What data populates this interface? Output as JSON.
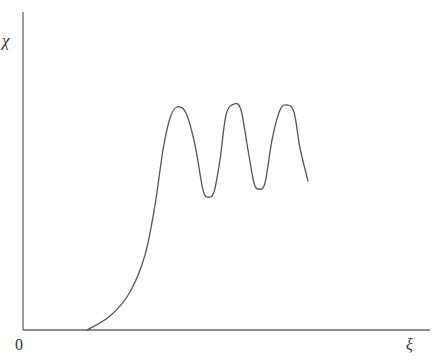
{
  "chart_data": {
    "type": "line",
    "title": "",
    "xlabel": "ξ",
    "ylabel": "χ",
    "origin_label": "0",
    "grid": false,
    "legend": null,
    "axis_ranges": {
      "x": [
        0,
        10
      ],
      "y": [
        0,
        10
      ]
    },
    "series": [
      {
        "name": "curve",
        "color": "#555555",
        "description": "zero until ~1.6, steep rise to first maximum, then three oscillating peaks of roughly equal height",
        "points_px": [
          [
            87,
            330
          ],
          [
            110,
            316
          ],
          [
            130,
            292
          ],
          [
            145,
            255
          ],
          [
            155,
            205
          ],
          [
            163,
            150
          ],
          [
            170,
            118
          ],
          [
            177,
            107
          ],
          [
            186,
            113
          ],
          [
            195,
            145
          ],
          [
            203,
            190
          ],
          [
            208,
            197
          ],
          [
            214,
            192
          ],
          [
            220,
            160
          ],
          [
            226,
            115
          ],
          [
            234,
            104
          ],
          [
            241,
            110
          ],
          [
            248,
            150
          ],
          [
            254,
            183
          ],
          [
            259,
            189
          ],
          [
            265,
            183
          ],
          [
            272,
            140
          ],
          [
            280,
            110
          ],
          [
            287,
            105
          ],
          [
            294,
            112
          ],
          [
            300,
            148
          ],
          [
            308,
            181
          ]
        ]
      }
    ]
  },
  "axes": {
    "color": "#666666",
    "y_axis": {
      "x": 23,
      "y_top": 12,
      "y_bottom": 330
    },
    "x_axis": {
      "y": 330,
      "x_left": 23,
      "x_right": 430
    }
  },
  "labels": {
    "y": "χ",
    "x": "ξ",
    "origin": "0"
  }
}
